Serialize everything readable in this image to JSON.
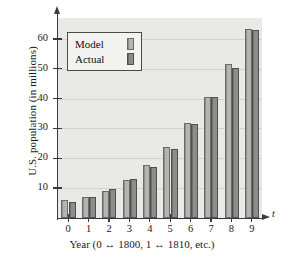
{
  "chart_data": {
    "type": "bar",
    "title": "",
    "xlabel": "Year (0 ↔ 1800, 1 ↔ 1810, etc.)",
    "ylabel": "U.S. population (in millions)",
    "axis_variable": "t",
    "categories": [
      "0",
      "1",
      "2",
      "3",
      "4",
      "5",
      "6",
      "7",
      "8",
      "9"
    ],
    "series": [
      {
        "name": "Model",
        "color": "#b4b4b2",
        "values": [
          5.9,
          7.1,
          9.2,
          12.6,
          17.7,
          23.9,
          31.7,
          40.7,
          51.5,
          63.2
        ]
      },
      {
        "name": "Actual",
        "color": "#8d8d8b",
        "values": [
          5.3,
          7.2,
          9.6,
          12.9,
          17.1,
          23.2,
          31.4,
          40.4,
          50.2,
          62.9
        ]
      }
    ],
    "ylim": [
      0,
      67
    ],
    "yticks": [
      10,
      20,
      30,
      40,
      50,
      60
    ],
    "ytick_labels": [
      "10",
      "20",
      "30",
      "40",
      "50",
      "60"
    ],
    "grid": true,
    "legend_position": "top-left",
    "plot_background": "#e9e9e7"
  },
  "legend": {
    "entries": [
      {
        "label": "Model",
        "swatch": "model"
      },
      {
        "label": "Actual",
        "swatch": "actual"
      }
    ]
  }
}
